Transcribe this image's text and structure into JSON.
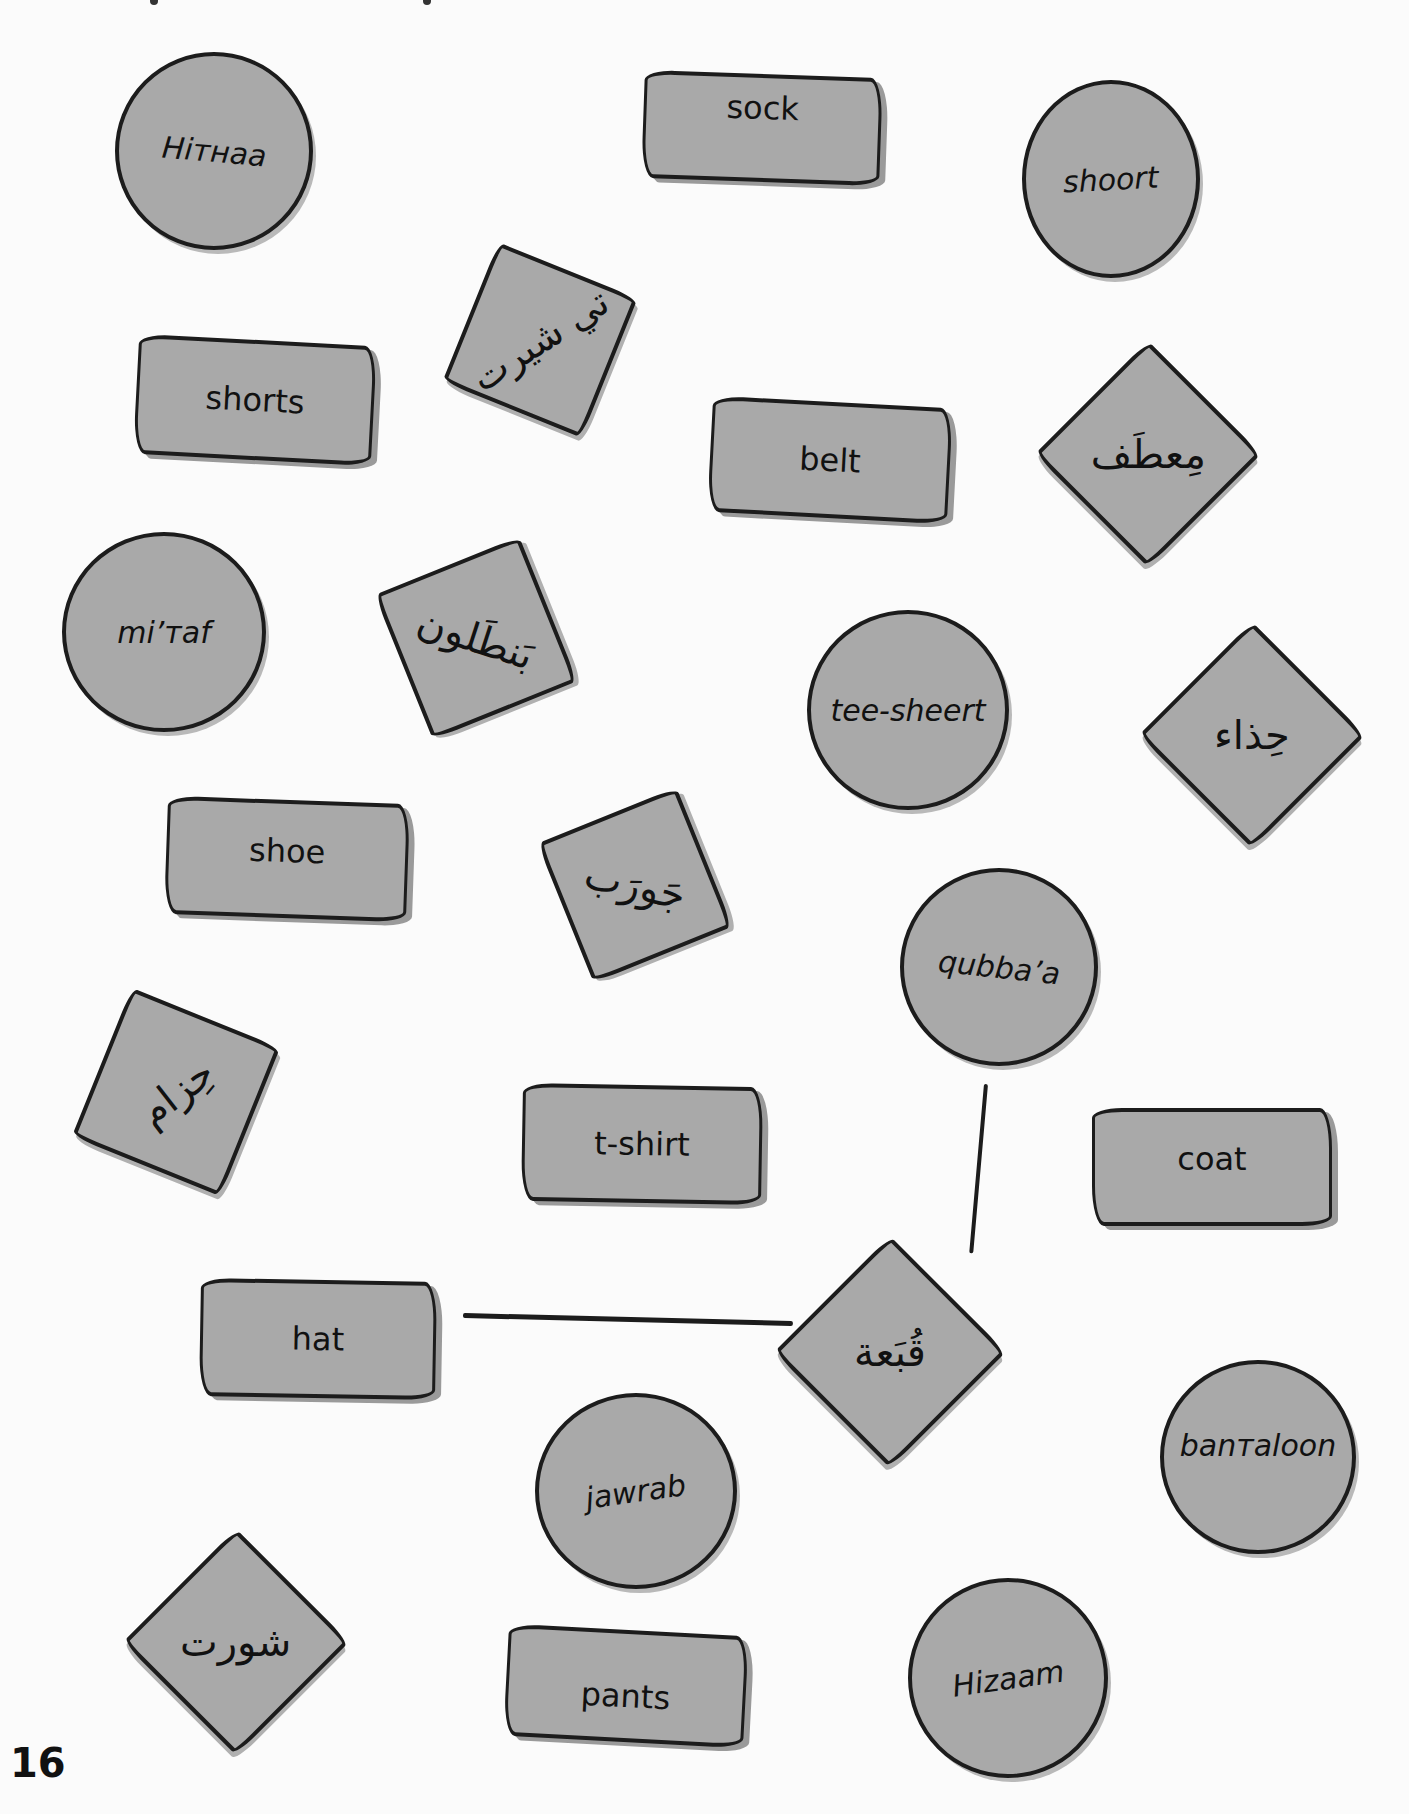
{
  "page": {
    "number": "16",
    "background_color": "#fbfbfb",
    "card_color": "#a9a9a9",
    "outline_color": "#1c1c1c"
  },
  "cards": {
    "circles": [
      {
        "id": "hithaa",
        "text": "Hiтнaa"
      },
      {
        "id": "shoort",
        "text": "shoort"
      },
      {
        "id": "mitaf",
        "text": "mi’тaf"
      },
      {
        "id": "tee_sheert",
        "text": "tee-sheert"
      },
      {
        "id": "qubbaa",
        "text": "qubba’a"
      },
      {
        "id": "bantaloon",
        "text": "banтaloon"
      },
      {
        "id": "jawrab",
        "text": "jawrab"
      },
      {
        "id": "hizaam",
        "text": "Hizaam"
      }
    ],
    "rectangles": [
      {
        "id": "sock",
        "text": "sock"
      },
      {
        "id": "shorts",
        "text": "shorts"
      },
      {
        "id": "belt",
        "text": "belt"
      },
      {
        "id": "shoe",
        "text": "shoe"
      },
      {
        "id": "tshirt",
        "text": "t-shirt"
      },
      {
        "id": "coat",
        "text": "coat"
      },
      {
        "id": "hat",
        "text": "hat"
      },
      {
        "id": "pants",
        "text": "pants"
      }
    ],
    "diamonds": [
      {
        "id": "tee_shirt_ar",
        "text": "تي شيرت"
      },
      {
        "id": "mitaf_ar",
        "text": "مِعطَف"
      },
      {
        "id": "bantaloon_ar",
        "text": "بَنطَلون"
      },
      {
        "id": "hithaa_ar",
        "text": "حِذاء"
      },
      {
        "id": "jawrab_ar",
        "text": "جَورَب"
      },
      {
        "id": "hizaam_ar",
        "text": "حِزام"
      },
      {
        "id": "qubbaa_ar",
        "text": "قُبَعة"
      },
      {
        "id": "shoort_ar",
        "text": "شورت"
      }
    ]
  },
  "connections": [
    {
      "from": "hat",
      "to": "qubbaa_ar"
    },
    {
      "from": "qubbaa",
      "to": "qubbaa_ar"
    }
  ]
}
